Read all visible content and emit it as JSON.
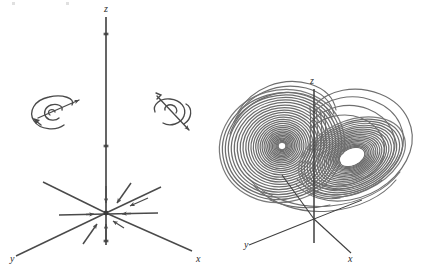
{
  "figure": {
    "title": "",
    "background_color": "#ffffff",
    "ink_color": "#4a4a4a",
    "label_color": "#2b2b2b",
    "width": 421,
    "height": 280
  },
  "panels": [
    {
      "id": "left",
      "name": "coordinate-axes-with-flow",
      "description": "3D coordinate axes with flow arrows converging toward the origin",
      "axes": [
        {
          "name": "z-axis",
          "label": "z",
          "label_x": 106,
          "label_y": 12
        },
        {
          "name": "y-axis",
          "label": "y",
          "label_x": 10,
          "label_y": 262
        },
        {
          "name": "x-axis",
          "label": "x",
          "label_x": 196,
          "label_y": 262
        }
      ],
      "icons": [
        {
          "name": "spiral-sink-icon",
          "cx": 54,
          "cy": 113
        },
        {
          "name": "spiral-saddle-icon",
          "cx": 170,
          "cy": 112
        }
      ],
      "origin": {
        "x": 106,
        "y": 213
      }
    },
    {
      "id": "right",
      "name": "lorenz-attractor",
      "description": "Lorenz strange attractor butterfly with two lobes",
      "axes": [
        {
          "name": "z-axis",
          "label": "z",
          "label_x": 312,
          "label_y": 84
        },
        {
          "name": "y-axis",
          "label": "y",
          "label_x": 244,
          "label_y": 248
        },
        {
          "name": "x-axis",
          "label": "x",
          "label_x": 348,
          "label_y": 260
        }
      ],
      "lobes": [
        {
          "name": "left-lobe",
          "cx": 282,
          "cy": 146,
          "hole": "white-center"
        },
        {
          "name": "right-lobe",
          "cx": 351,
          "cy": 157,
          "hole": "white-ellipse"
        }
      ],
      "origin": {
        "x": 314,
        "y": 219
      }
    }
  ]
}
